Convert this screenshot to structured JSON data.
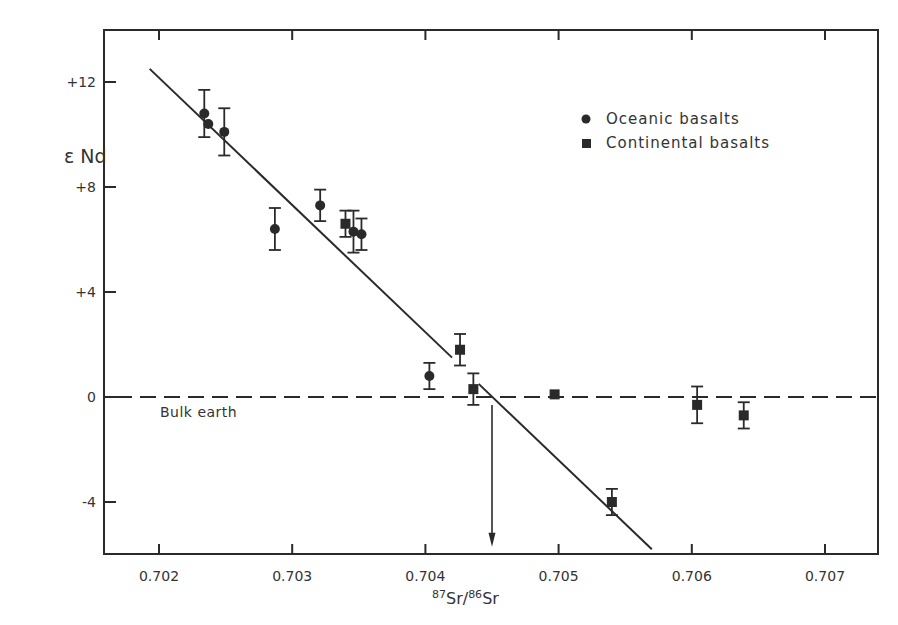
{
  "chart_data": {
    "type": "scatter",
    "title": "",
    "xlabel": "87Sr/86Sr",
    "xlabel_parts": {
      "sup1": "87",
      "base1": "Sr",
      "sep": "/",
      "sup2": "86",
      "base2": "Sr"
    },
    "ylabel": "ε Nd",
    "xlim": [
      0.70159,
      0.7074
    ],
    "ylim": [
      -6.0,
      14.0
    ],
    "x_ticks": [
      0.702,
      0.703,
      0.704,
      0.705,
      0.706,
      0.707
    ],
    "x_tick_labels": [
      "0.702",
      "0.703",
      "0.704",
      "0.705",
      "0.706",
      "0.707"
    ],
    "y_ticks": [
      12,
      8,
      4,
      0,
      -4
    ],
    "y_tick_labels": [
      "+12",
      "+8",
      "+4",
      "0",
      "-4"
    ],
    "grid": false,
    "legend_position": "upper right",
    "series": [
      {
        "name": "Oceanic basalts",
        "marker": "circle",
        "points": [
          {
            "x": 0.70234,
            "y": 10.8,
            "err": 0.9
          },
          {
            "x": 0.70237,
            "y": 10.4,
            "err": 0
          },
          {
            "x": 0.70249,
            "y": 10.1,
            "err": 0.9
          },
          {
            "x": 0.70287,
            "y": 6.4,
            "err": 0.8
          },
          {
            "x": 0.70321,
            "y": 7.3,
            "err": 0.6
          },
          {
            "x": 0.70346,
            "y": 6.3,
            "err": 0.8
          },
          {
            "x": 0.70352,
            "y": 6.2,
            "err": 0.6
          },
          {
            "x": 0.70403,
            "y": 0.8,
            "err": 0.5
          }
        ]
      },
      {
        "name": "Continental basalts",
        "marker": "square",
        "points": [
          {
            "x": 0.7034,
            "y": 6.6,
            "err": 0.5
          },
          {
            "x": 0.70426,
            "y": 1.8,
            "err": 0.6
          },
          {
            "x": 0.70436,
            "y": 0.3,
            "err": 0.6
          },
          {
            "x": 0.70497,
            "y": 0.1,
            "err": 0
          },
          {
            "x": 0.7054,
            "y": -4.0,
            "err": 0.5
          },
          {
            "x": 0.70604,
            "y": -0.3,
            "err": 0.7
          },
          {
            "x": 0.70639,
            "y": -0.7,
            "err": 0.5
          }
        ]
      }
    ],
    "trend_lines": [
      {
        "x1": 0.70193,
        "y1": 12.5,
        "x2": 0.7042,
        "y2": 1.5
      },
      {
        "x1": 0.7044,
        "y1": 0.5,
        "x2": 0.7057,
        "y2": -5.8
      }
    ],
    "reference_line": {
      "y": 0,
      "style": "dashed",
      "label": "Bulk earth"
    },
    "annotations": [
      {
        "type": "arrow",
        "x": 0.7045,
        "from_y": -0.3,
        "to_y": -5.7,
        "note": "intercept with bulk earth"
      }
    ],
    "legend": [
      {
        "label": "Oceanic basalts",
        "marker": "circle"
      },
      {
        "label": "Continental basalts",
        "marker": "square"
      }
    ]
  },
  "colors": {
    "ink": "#2a2a2a",
    "background": "#ffffff"
  }
}
